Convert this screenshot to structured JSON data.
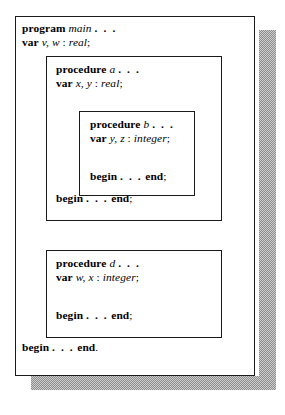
{
  "figure": {
    "kind": "nested-scope-diagram",
    "language": "Pascal",
    "colors": {
      "page_background": "#ffffff",
      "box_background": "#ffffff",
      "border": "#1a1a1a",
      "shadow": "#8e8e8e",
      "text": "#000000"
    }
  },
  "program": {
    "header": {
      "keyword": "program",
      "name": "main",
      "ellipsis": ". . ."
    },
    "declaration": {
      "keyword": "var",
      "names": "v, w",
      "separator": " : ",
      "type": "real",
      "terminator": ";"
    },
    "body": {
      "begin": "begin",
      "ellipsis": ". . .",
      "end": "end",
      "terminator": "."
    }
  },
  "procedure_a": {
    "header": {
      "keyword": "procedure",
      "name": "a",
      "ellipsis": ". . ."
    },
    "declaration": {
      "keyword": "var",
      "names": "x, y",
      "separator": " : ",
      "type": "real",
      "terminator": ";"
    },
    "body": {
      "begin": "begin",
      "ellipsis": ". . .",
      "end": "end",
      "terminator": ";"
    }
  },
  "procedure_b": {
    "header": {
      "keyword": "procedure",
      "name": "b",
      "ellipsis": ". . ."
    },
    "declaration": {
      "keyword": "var",
      "names": "y, z",
      "separator": " : ",
      "type": "integer",
      "terminator": ";"
    },
    "body": {
      "begin": "begin",
      "ellipsis": ". . .",
      "end": "end",
      "terminator": ";"
    }
  },
  "procedure_d": {
    "header": {
      "keyword": "procedure",
      "name": "d",
      "ellipsis": ". . ."
    },
    "declaration": {
      "keyword": "var",
      "names": "w, x",
      "separator": " : ",
      "type": "integer",
      "terminator": ";"
    },
    "body": {
      "begin": "begin",
      "ellipsis": ". . .",
      "end": "end",
      "terminator": ";"
    }
  }
}
